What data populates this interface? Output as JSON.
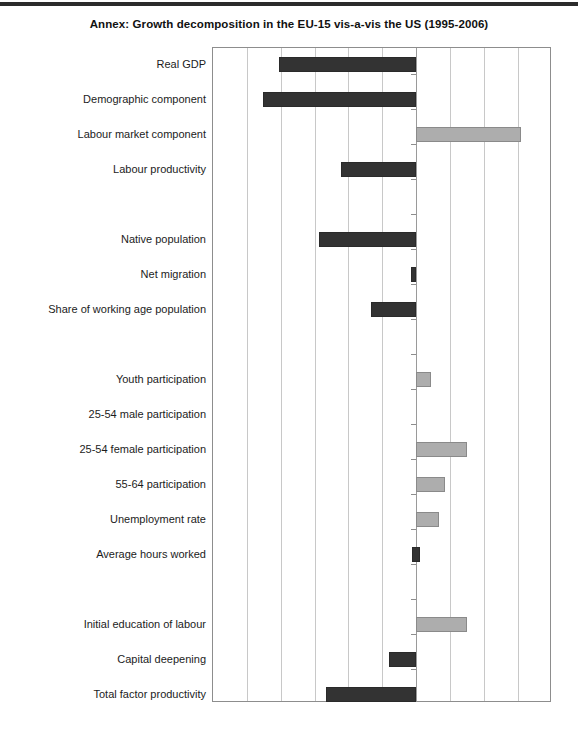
{
  "title": "Annex: Growth decomposition in the EU-15 vis-a-vis the US (1995-2006)",
  "colors": {
    "negative_bar": "#333333",
    "positive_bar": "#adadad",
    "gridline": "#c8c8c8",
    "axis": "#8d8d8d",
    "background": "#ffffff"
  },
  "chart_data": {
    "type": "bar",
    "orientation": "horizontal",
    "title": "Annex: Growth decomposition in the EU-15 vis-a-vis the US (1995-2006)",
    "xlabel": "",
    "ylabel": "",
    "xlim": [
      -6,
      4
    ],
    "xticks": [
      -6,
      -5,
      -4,
      -3,
      -2,
      -1,
      0,
      1,
      2,
      3,
      4
    ],
    "grid": true,
    "legend": "none",
    "axis_labels_shown": false,
    "categories": [
      "Real GDP",
      "Demographic component",
      "Labour market component",
      "Labour productivity",
      "",
      "Native population",
      "Net migration",
      "Share of working age population",
      "",
      "Youth participation",
      "25-54 male participation",
      "25-54 female participation",
      "55-64 participation",
      "Unemployment rate",
      "Average hours worked",
      "",
      "Initial education of labour",
      "Capital deepening",
      "Total factor productivity"
    ],
    "values": [
      -4.05,
      -4.52,
      3.1,
      -2.21,
      null,
      -2.86,
      -0.15,
      -1.33,
      null,
      0.44,
      0.0,
      1.5,
      0.85,
      0.68,
      -0.12,
      null,
      1.5,
      -0.8,
      -2.65
    ],
    "bars": [
      {
        "label": "Real GDP",
        "value": -4.05,
        "sign": "negative"
      },
      {
        "label": "Demographic component",
        "value": -4.52,
        "sign": "negative"
      },
      {
        "label": "Labour market component",
        "value": 3.1,
        "sign": "positive"
      },
      {
        "label": "Labour productivity",
        "value": -2.21,
        "sign": "negative"
      },
      {
        "label": "Native population",
        "value": -2.86,
        "sign": "negative"
      },
      {
        "label": "Net migration",
        "value": -0.15,
        "sign": "negative"
      },
      {
        "label": "Share of working age population",
        "value": -1.33,
        "sign": "negative"
      },
      {
        "label": "Youth participation",
        "value": 0.44,
        "sign": "positive"
      },
      {
        "label": "25-54 male participation",
        "value": 0.0,
        "sign": "zero"
      },
      {
        "label": "25-54 female participation",
        "value": 1.5,
        "sign": "positive"
      },
      {
        "label": "55-64 participation",
        "value": 0.85,
        "sign": "positive"
      },
      {
        "label": "Unemployment rate",
        "value": 0.68,
        "sign": "positive"
      },
      {
        "label": "Average hours worked",
        "value": -0.12,
        "sign": "negative"
      },
      {
        "label": "Initial education of labour",
        "value": 1.5,
        "sign": "positive"
      },
      {
        "label": "Capital deepening",
        "value": -0.8,
        "sign": "negative"
      },
      {
        "label": "Total factor productivity",
        "value": -2.65,
        "sign": "negative"
      }
    ]
  },
  "rows": [
    {
      "label": "Real GDP",
      "y": 9,
      "bar": {
        "x": 66,
        "w": 137,
        "cls": "neg"
      }
    },
    {
      "label": "Demographic component",
      "y": 44,
      "bar": {
        "x": 50,
        "w": 153,
        "cls": "neg"
      }
    },
    {
      "label": "Labour market component",
      "y": 79,
      "bar": {
        "x": 203,
        "w": 105,
        "cls": "pos"
      }
    },
    {
      "label": "Labour productivity",
      "y": 114,
      "bar": {
        "x": 128,
        "w": 75,
        "cls": "neg"
      }
    },
    {
      "label": "",
      "y": 149,
      "bar": null
    },
    {
      "label": "Native population",
      "y": 184,
      "bar": {
        "x": 106,
        "w": 97,
        "cls": "neg"
      }
    },
    {
      "label": "Net migration",
      "y": 219,
      "bar": {
        "x": 198,
        "w": 5,
        "cls": "neg"
      }
    },
    {
      "label": "Share of working age population",
      "y": 254,
      "bar": {
        "x": 158,
        "w": 45,
        "cls": "neg"
      }
    },
    {
      "label": "",
      "y": 289,
      "bar": null
    },
    {
      "label": "Youth participation",
      "y": 324,
      "bar": {
        "x": 203,
        "w": 15,
        "cls": "pos"
      }
    },
    {
      "label": "25-54 male participation",
      "y": 359,
      "bar": null
    },
    {
      "label": "25-54 female participation",
      "y": 394,
      "bar": {
        "x": 203,
        "w": 51,
        "cls": "pos"
      }
    },
    {
      "label": "55-64 participation",
      "y": 429,
      "bar": {
        "x": 203,
        "w": 29,
        "cls": "pos"
      }
    },
    {
      "label": "Unemployment rate",
      "y": 464,
      "bar": {
        "x": 203,
        "w": 23,
        "cls": "pos"
      }
    },
    {
      "label": "Average hours worked",
      "y": 499,
      "bar": {
        "x": 199,
        "w": 8,
        "cls": "posdark"
      }
    },
    {
      "label": "",
      "y": 534,
      "bar": null
    },
    {
      "label": "Initial education of labour",
      "y": 569,
      "bar": {
        "x": 203,
        "w": 51,
        "cls": "pos"
      }
    },
    {
      "label": "Capital deepening",
      "y": 604,
      "bar": {
        "x": 176,
        "w": 27,
        "cls": "neg"
      }
    },
    {
      "label": "Total factor productivity",
      "y": 639,
      "bar": {
        "x": 113,
        "w": 90,
        "cls": "neg"
      }
    }
  ],
  "axis": {
    "gridline_xs": [
      34,
      68,
      102,
      135,
      169,
      237,
      271,
      305
    ],
    "zero_x": 203,
    "tick_ys": [
      26,
      61,
      96,
      131,
      166,
      201,
      236,
      271,
      306,
      341,
      376,
      411,
      446,
      481,
      516,
      551,
      586,
      621
    ]
  }
}
